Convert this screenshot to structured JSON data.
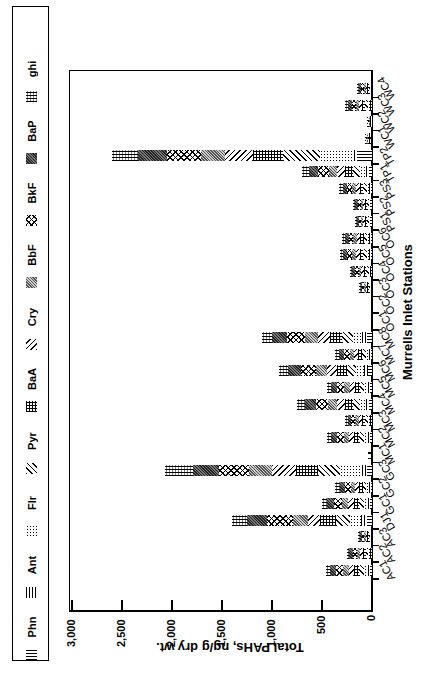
{
  "chart_data": {
    "type": "bar",
    "stacked": true,
    "orientation": "rotated-90-clockwise",
    "title": "",
    "xlabel": "Murrells Inlet Stations",
    "ylabel": "Total PAHs, ng/g dry wt.",
    "ylim": [
      0,
      3000
    ],
    "yticks": [
      0,
      500,
      1000,
      1500,
      2000,
      2500,
      3000
    ],
    "ytick_labels": [
      "0",
      "500",
      "1,000",
      "1,500",
      "2,000",
      "2,500",
      "3,000"
    ],
    "grid": false,
    "legend_position": "top (rendered left after rotation)",
    "legend": [
      "Phn",
      "Ant",
      "Flr",
      "Pyr",
      "BaA",
      "Cry",
      "BbF",
      "BkF",
      "BaP",
      "ghi"
    ],
    "categories": [
      "AC1",
      "AC2",
      "AC3",
      "DJ1",
      "GC1",
      "GC2",
      "GC3",
      "MC1",
      "MC2",
      "MC3",
      "MC4",
      "MC5",
      "MC6",
      "MC7",
      "MC8",
      "OC1",
      "OC2",
      "OC3",
      "OC4",
      "OC5",
      "OC6",
      "PS1",
      "PS2",
      "PS3",
      "TP1",
      "TP2",
      "WC1",
      "WC2",
      "WC3",
      "WC4"
    ],
    "totals": [
      460,
      250,
      140,
      1400,
      500,
      340,
      2070,
      40,
      450,
      270,
      750,
      450,
      930,
      370,
      1100,
      5,
      5,
      130,
      220,
      320,
      300,
      170,
      190,
      330,
      700,
      2600,
      70,
      50,
      270,
      150
    ],
    "series": [
      {
        "name": "Phn",
        "values": [
          20,
          10,
          5,
          50,
          20,
          15,
          50,
          5,
          20,
          10,
          30,
          20,
          40,
          15,
          50,
          0,
          0,
          5,
          10,
          15,
          15,
          10,
          10,
          15,
          30,
          150,
          5,
          5,
          10,
          5
        ]
      },
      {
        "name": "Ant",
        "values": [
          20,
          10,
          5,
          60,
          20,
          15,
          50,
          5,
          20,
          10,
          30,
          20,
          40,
          15,
          50,
          0,
          0,
          5,
          10,
          15,
          15,
          5,
          5,
          15,
          30,
          30,
          5,
          0,
          10,
          5
        ]
      },
      {
        "name": "Flr",
        "values": [
          40,
          20,
          10,
          110,
          40,
          30,
          220,
          5,
          40,
          25,
          60,
          40,
          80,
          30,
          90,
          0,
          0,
          10,
          15,
          25,
          25,
          15,
          15,
          25,
          60,
          340,
          5,
          5,
          20,
          10
        ]
      },
      {
        "name": "Pyr",
        "values": [
          50,
          25,
          15,
          140,
          50,
          35,
          220,
          5,
          50,
          30,
          70,
          45,
          90,
          40,
          110,
          0,
          0,
          15,
          25,
          35,
          30,
          20,
          20,
          35,
          70,
          370,
          10,
          5,
          30,
          15
        ]
      },
      {
        "name": "BaA",
        "values": [
          50,
          30,
          15,
          160,
          55,
          40,
          220,
          5,
          50,
          30,
          80,
          50,
          100,
          40,
          120,
          0,
          0,
          15,
          25,
          35,
          35,
          20,
          20,
          35,
          80,
          300,
          10,
          5,
          30,
          15
        ]
      },
      {
        "name": "Cry",
        "values": [
          50,
          30,
          15,
          120,
          55,
          40,
          240,
          5,
          50,
          30,
          80,
          50,
          100,
          40,
          120,
          0,
          0,
          15,
          25,
          35,
          35,
          20,
          20,
          35,
          80,
          280,
          10,
          5,
          30,
          15
        ]
      },
      {
        "name": "BbF",
        "values": [
          60,
          30,
          20,
          150,
          60,
          40,
          230,
          5,
          55,
          35,
          90,
          55,
          110,
          45,
          130,
          0,
          0,
          15,
          25,
          40,
          35,
          20,
          25,
          40,
          80,
          240,
          5,
          5,
          30,
          20
        ]
      },
      {
        "name": "BkF",
        "values": [
          70,
          40,
          20,
          260,
          80,
          55,
          300,
          5,
          70,
          40,
          120,
          70,
          150,
          60,
          180,
          5,
          5,
          20,
          35,
          50,
          45,
          25,
          30,
          50,
          110,
          340,
          10,
          10,
          40,
          25
        ]
      },
      {
        "name": "BaP",
        "values": [
          60,
          35,
          20,
          200,
          70,
          50,
          260,
          0,
          60,
          35,
          110,
          60,
          130,
          50,
          150,
          0,
          0,
          15,
          30,
          40,
          40,
          20,
          25,
          45,
          90,
          290,
          5,
          5,
          40,
          20
        ]
      },
      {
        "name": "ghi",
        "values": [
          40,
          20,
          15,
          150,
          50,
          55,
          280,
          0,
          35,
          25,
          80,
          40,
          90,
          35,
          100,
          0,
          0,
          15,
          20,
          30,
          25,
          15,
          20,
          35,
          70,
          260,
          5,
          5,
          30,
          20
        ]
      }
    ]
  },
  "legend_items": [
    {
      "label": "Phn",
      "pattern": "p-phn"
    },
    {
      "label": "Ant",
      "pattern": "p-ant"
    },
    {
      "label": "Flr",
      "pattern": "p-flr"
    },
    {
      "label": "Pyr",
      "pattern": "p-pyr"
    },
    {
      "label": "BaA",
      "pattern": "p-baa"
    },
    {
      "label": "Cry",
      "pattern": "p-cry"
    },
    {
      "label": "BbF",
      "pattern": "p-bbf"
    },
    {
      "label": "BkF",
      "pattern": "p-bkf"
    },
    {
      "label": "BaP",
      "pattern": "p-bap"
    },
    {
      "label": "ghi",
      "pattern": "p-ghi"
    }
  ],
  "axes": {
    "x_title": "Murrells Inlet Stations",
    "y_title": "Total PAHs, ng/g dry wt."
  }
}
